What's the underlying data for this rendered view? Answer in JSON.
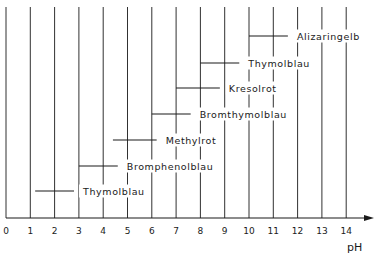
{
  "chart_data": {
    "type": "range-bar",
    "title": "",
    "xlabel": "pH",
    "ylabel": "",
    "xlim": [
      0,
      14
    ],
    "x_ticks": [
      0,
      1,
      2,
      3,
      4,
      5,
      6,
      7,
      8,
      9,
      10,
      11,
      12,
      13,
      14
    ],
    "grid": "vertical lines at each integer pH",
    "series": [
      {
        "name": "Thymolblau",
        "start": 1.2,
        "end": 2.8
      },
      {
        "name": "Bromphenolblau",
        "start": 3.0,
        "end": 4.6
      },
      {
        "name": "Methylrot",
        "start": 4.4,
        "end": 6.2
      },
      {
        "name": "Bromthymolblau",
        "start": 6.0,
        "end": 7.6
      },
      {
        "name": "Kresolrot",
        "start": 7.0,
        "end": 8.8
      },
      {
        "name": "Thymolblau",
        "start": 8.0,
        "end": 9.6
      },
      {
        "name": "Alizaringelb",
        "start": 10.0,
        "end": 11.6
      }
    ]
  },
  "colors": {
    "line": "#1a1a1a",
    "background": "#ffffff"
  }
}
